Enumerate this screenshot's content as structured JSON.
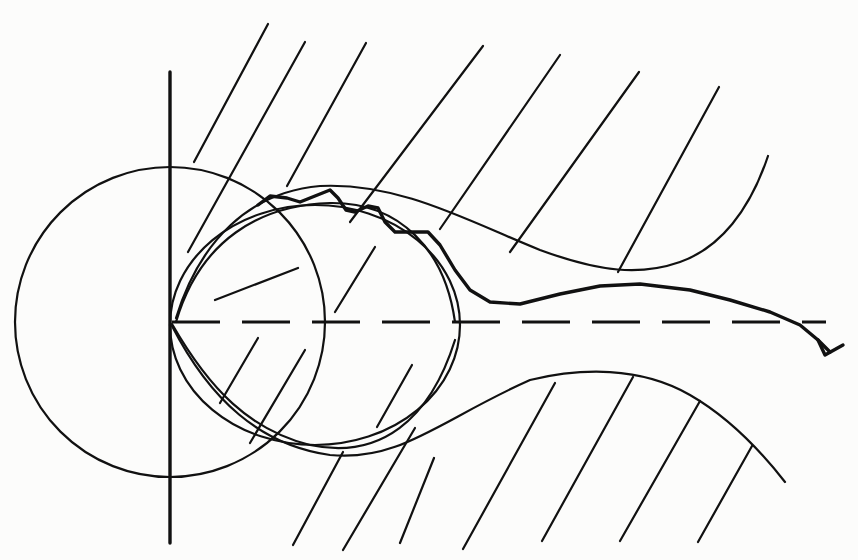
{
  "figure": {
    "colors": {
      "ink": "#111111",
      "paper": "#fcfcfb"
    },
    "vertical_axis": {
      "x": 170,
      "y1": 72,
      "y2": 543
    },
    "dashed_axis": {
      "y": 322,
      "x1": 172,
      "x2": 826
    },
    "big_circle": {
      "cx": 170,
      "cy": 322,
      "r": 155
    },
    "inner_circle": {
      "cx": 315,
      "cy": 325,
      "rx": 145,
      "ry": 120
    },
    "upper_wall_path": "M 176 318 C 200 240, 250 192, 320 186 C 400 182, 470 222, 540 250 C 600 272, 640 276, 680 262 C 720 248, 750 210, 768 156",
    "upper_inner_arc": "M 176 322 C 200 240, 260 205, 330 203 C 400 202, 445 250, 455 322",
    "lower_wall_path": "M 172 326 C 210 400, 260 445, 330 455 C 400 462, 440 420, 530 380 C 580 368, 640 366, 690 395 C 730 418, 760 450, 785 482",
    "lower_inner_arc": "M 172 324 C 210 390, 250 430, 310 445 C 380 460, 430 420, 455 340",
    "trajectory_path": "M 258 205 L 270 196 L 287 198 L 300 202 L 315 196 L 330 190 L 338 198 L 346 210 L 355 212 L 368 206 L 378 208 L 385 222 L 395 232 L 410 232 L 428 232 L 440 245 L 455 270 L 470 290 L 490 302 L 520 304 L 560 294 L 600 286 L 640 284 L 690 290 L 730 300 L 770 312 L 800 325 L 818 340 L 830 352",
    "arrowhead": {
      "tip": [
        825,
        355
      ],
      "barbs": [
        [
          818,
          340
        ],
        [
          843,
          345
        ]
      ]
    },
    "hatches_upper": [
      [
        194,
        162,
        268,
        24
      ],
      [
        188,
        252,
        305,
        42
      ],
      [
        287,
        186,
        366,
        43
      ],
      [
        350,
        222,
        483,
        46
      ],
      [
        440,
        229,
        560,
        55
      ],
      [
        510,
        252,
        639,
        72
      ],
      [
        618,
        272,
        719,
        87
      ],
      [
        215,
        300,
        298,
        268
      ],
      [
        335,
        312,
        375,
        247
      ]
    ],
    "hatches_lower": [
      [
        220,
        403,
        258,
        338
      ],
      [
        250,
        443,
        305,
        350
      ],
      [
        293,
        545,
        343,
        452
      ],
      [
        343,
        550,
        415,
        428
      ],
      [
        400,
        543,
        434,
        458
      ],
      [
        463,
        549,
        555,
        383
      ],
      [
        542,
        541,
        633,
        377
      ],
      [
        620,
        541,
        700,
        401
      ],
      [
        698,
        542,
        752,
        446
      ],
      [
        377,
        427,
        412,
        365
      ]
    ]
  }
}
